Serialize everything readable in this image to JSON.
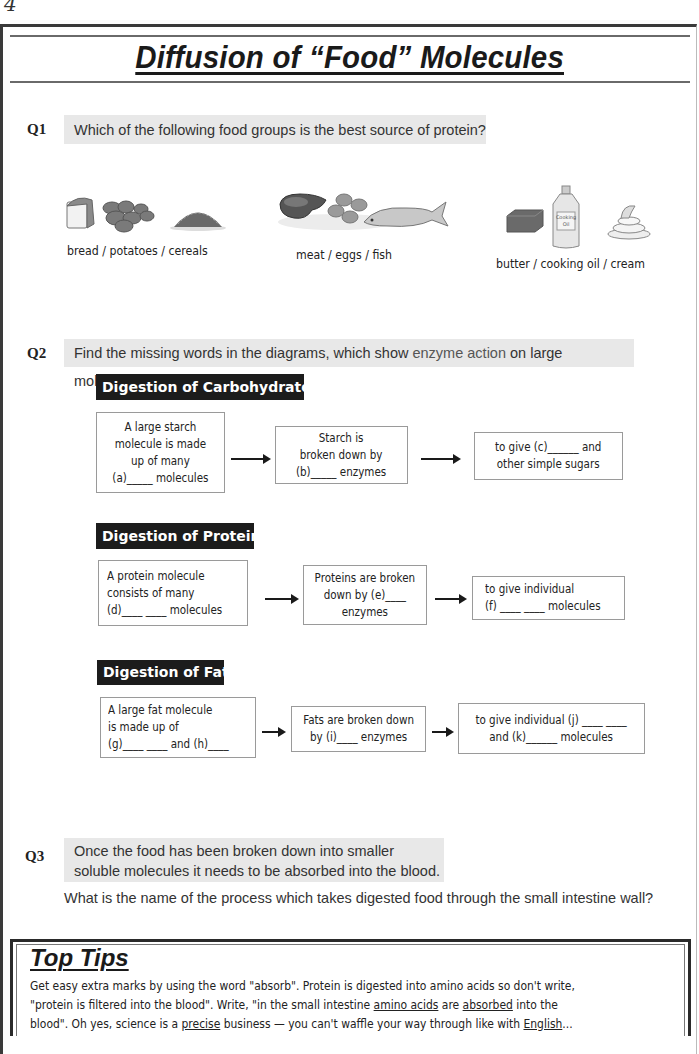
{
  "page": {
    "number": "4",
    "title": "Diffusion of “Food” Molecules"
  },
  "q1": {
    "label": "Q1",
    "question": "Which of the following food groups is the best source of protein?",
    "options": [
      {
        "label": "bread / potatoes / cereals",
        "icons": [
          "bread-icon",
          "potatoes-icon",
          "cereals-icon"
        ]
      },
      {
        "label": "meat / eggs / fish",
        "icons": [
          "meat-icon",
          "eggs-icon",
          "fish-icon"
        ]
      },
      {
        "label": "butter / cooking oil / cream",
        "icons": [
          "butter-icon",
          "cooking-oil-icon",
          "cream-icon"
        ],
        "bottle_label": "Cooking Oil"
      }
    ]
  },
  "q2": {
    "label": "Q2",
    "question_prefix": "Find the missing words in the diagrams, which show ",
    "question_highlight": "enzyme action",
    "question_suffix": " on large molecules.",
    "sections": [
      {
        "heading": "Digestion of Carbohydrates",
        "boxes": [
          "A large starch\nmolecule is made\nup of many\n(a)_____ molecules",
          "Starch is\nbroken down by\n(b)_____ enzymes",
          "to give (c)______ and\nother simple sugars"
        ]
      },
      {
        "heading": "Digestion of Proteins",
        "boxes": [
          "A protein molecule\nconsists of many\n(d)____ ____ molecules",
          "Proteins are broken\ndown by (e)____\nenzymes",
          "to give individual\n(f) ____ ____ molecules"
        ]
      },
      {
        "heading": "Digestion of Fats",
        "boxes": [
          "A large fat molecule\nis made up of\n(g)____ ____ and (h)____",
          "Fats are broken down\nby (i)____ enzymes",
          "to give individual (j) ____ ____\nand (k)______ molecules"
        ]
      }
    ]
  },
  "q3": {
    "label": "Q3",
    "statement_line1": "Once the food has been broken down into smaller",
    "statement_line2": "soluble molecules it needs to be absorbed into the blood.",
    "question": "What is the name of the process which takes digested food through the small intestine wall?"
  },
  "top_tips": {
    "title": "Top Tips",
    "line1": "Get easy extra marks by using the word \"absorb\".  Protein is digested into amino acids so don't write,",
    "line2_a": "\"protein is filtered into the blood\".  Write, \"in the small intestine ",
    "line2_u1": "amino acids",
    "line2_b": " are ",
    "line2_u2": "absorbed",
    "line2_c": " into the",
    "line3_a": "blood\".  Oh yes, science is a ",
    "line3_u1": "precise",
    "line3_b": " business — you can't waffle your way through like with ",
    "line3_u2": "English",
    "line3_c": "..."
  }
}
